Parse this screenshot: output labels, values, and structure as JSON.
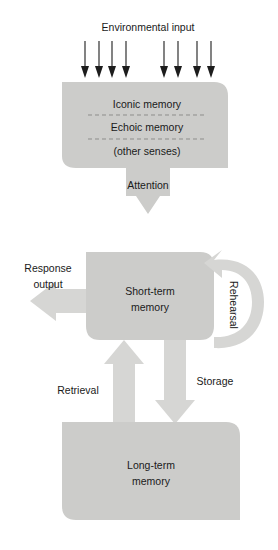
{
  "diagram": {
    "title_label": "Environmental input",
    "sensory_memory": {
      "rows": [
        "Iconic memory",
        "Echoic memory",
        "(other senses)"
      ]
    },
    "short_term_memory": {
      "line1": "Short-term",
      "line2": "memory"
    },
    "long_term_memory": {
      "line1": "Long-term",
      "line2": "memory"
    },
    "flows": {
      "attention": "Attention",
      "rehearsal": "Rehearsal",
      "storage": "Storage",
      "retrieval": "Retrieval",
      "response_output_line1": "Response",
      "response_output_line2": "output"
    },
    "colors": {
      "shape_fill": "#ccccca",
      "arrow_fill": "#d6d6d4",
      "text": "#1a1a1a",
      "separator": "#8d8d8b",
      "input_arrow": "#1d1d1d",
      "background": "#ffffff"
    },
    "input_arrow_count": 8
  }
}
